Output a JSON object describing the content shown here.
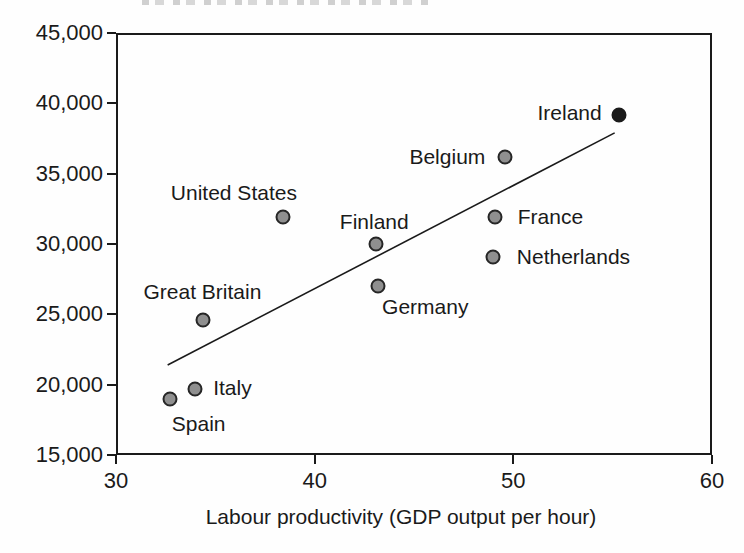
{
  "figure": {
    "x_axis_title": "Labour productivity (GDP output per hour)"
  },
  "chart_data": {
    "type": "scatter",
    "title": "",
    "xlabel": "Labour productivity (GDP output per hour)",
    "ylabel": "",
    "xlim": [
      30,
      60
    ],
    "ylim": [
      15000,
      45000
    ],
    "grid": false,
    "legend": false,
    "x_ticks": [
      {
        "value": 30,
        "label": "30"
      },
      {
        "value": 40,
        "label": "40"
      },
      {
        "value": 50,
        "label": "50"
      },
      {
        "value": 60,
        "label": "60"
      }
    ],
    "y_ticks": [
      {
        "value": 45000,
        "label": "45,000"
      },
      {
        "value": 40000,
        "label": "40,000"
      },
      {
        "value": 35000,
        "label": "35,000"
      },
      {
        "value": 30000,
        "label": "30,000"
      },
      {
        "value": 25000,
        "label": "25,000"
      },
      {
        "value": 20000,
        "label": "20,000"
      },
      {
        "value": 15000,
        "label": "15,000"
      }
    ],
    "points": [
      {
        "name": "Spain",
        "x": 32.7,
        "y": 19000,
        "variant": "gray",
        "label_dx": 29,
        "label_dy": 25
      },
      {
        "name": "Italy",
        "x": 34.0,
        "y": 19700,
        "variant": "gray",
        "label_dx": 37,
        "label_dy": -1
      },
      {
        "name": "Great Britain",
        "x": 34.4,
        "y": 24600,
        "variant": "gray",
        "label_dx": -1,
        "label_dy": -28
      },
      {
        "name": "United States",
        "x": 38.4,
        "y": 31900,
        "variant": "gray",
        "label_dx": -49,
        "label_dy": -24
      },
      {
        "name": "Finland",
        "x": 43.1,
        "y": 30000,
        "variant": "gray",
        "label_dx": -2,
        "label_dy": -22
      },
      {
        "name": "Germany",
        "x": 43.2,
        "y": 27000,
        "variant": "gray",
        "label_dx": 47,
        "label_dy": 21
      },
      {
        "name": "Netherlands",
        "x": 49.0,
        "y": 29100,
        "variant": "gray",
        "label_dx": 80,
        "label_dy": 0
      },
      {
        "name": "France",
        "x": 49.1,
        "y": 31900,
        "variant": "gray",
        "label_dx": 55,
        "label_dy": 0
      },
      {
        "name": "Belgium",
        "x": 49.6,
        "y": 36200,
        "variant": "gray",
        "label_dx": -58,
        "label_dy": 0
      },
      {
        "name": "Ireland",
        "x": 55.3,
        "y": 39200,
        "variant": "dark",
        "label_dx": -49,
        "label_dy": -2
      }
    ],
    "trend_line": {
      "x1": 32.6,
      "y1": 21400,
      "x2": 55.1,
      "y2": 37900
    },
    "colors": {
      "dot_fill": "#8f8f8f",
      "dot_stroke": "#262626",
      "highlight_fill": "#1b1b1b",
      "axis": "#1a1a1a",
      "text": "#1a1a1a",
      "background": "#fefefe"
    }
  }
}
